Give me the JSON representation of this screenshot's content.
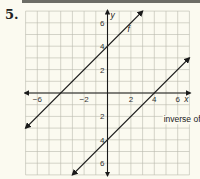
{
  "problem": {
    "number": "5."
  },
  "chart_data": {
    "type": "line",
    "title": "",
    "xlabel": "x",
    "ylabel": "y",
    "xlim": [
      -7,
      7
    ],
    "ylim": [
      -7,
      7
    ],
    "grid": true,
    "x_tick_labels": [
      "−6",
      "−2",
      "2",
      "4",
      "6"
    ],
    "x_tick_values": [
      -6,
      -2,
      2,
      4,
      6
    ],
    "y_tick_labels": [
      "6",
      "4",
      "2",
      "2",
      "4",
      "6"
    ],
    "y_tick_values": [
      6,
      4,
      2,
      -2,
      -4,
      -6
    ],
    "series": [
      {
        "name": "f",
        "label": "f",
        "equation": "y = x + 4",
        "points": [
          [
            -7,
            -3
          ],
          [
            3,
            7
          ]
        ],
        "arrows": "both"
      },
      {
        "name": "inverse of f",
        "label": "inverse of f",
        "equation": "y = x − 4",
        "points": [
          [
            -3,
            -7
          ],
          [
            7,
            3
          ]
        ],
        "arrows": "both"
      }
    ],
    "annotations": [
      {
        "text": "f",
        "x": 1.7,
        "y": 5.2
      },
      {
        "text": "inverse of f",
        "x": 4.8,
        "y": -2.5
      }
    ]
  }
}
